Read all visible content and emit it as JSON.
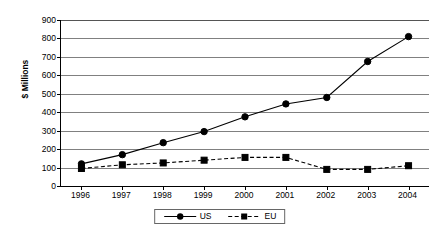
{
  "chart_data": {
    "type": "line",
    "title": "",
    "xlabel": "",
    "ylabel": "$ Millions",
    "categories": [
      "1996",
      "1997",
      "1998",
      "1999",
      "2000",
      "2001",
      "2002",
      "2003",
      "2004"
    ],
    "ylim": [
      0,
      900
    ],
    "ytick_step": 100,
    "yticks": [
      0,
      100,
      200,
      300,
      400,
      500,
      600,
      700,
      800,
      900
    ],
    "ytick_labels": [
      "0",
      "100",
      "200",
      "300",
      "400",
      "500",
      "600",
      "700",
      "800",
      "900"
    ],
    "grid": true,
    "legend_position": "bottom-center",
    "series": [
      {
        "name": "US",
        "marker": "circle",
        "line_style": "solid",
        "color": "#000000",
        "values": [
          120,
          170,
          235,
          295,
          375,
          445,
          480,
          675,
          810
        ]
      },
      {
        "name": "EU",
        "marker": "square",
        "line_style": "dashed",
        "color": "#000000",
        "values": [
          95,
          115,
          125,
          140,
          155,
          155,
          90,
          90,
          110
        ]
      }
    ]
  },
  "legend": {
    "entries": [
      {
        "label": "US"
      },
      {
        "label": "EU"
      }
    ]
  },
  "axes": {
    "y_title": "$ Millions"
  }
}
